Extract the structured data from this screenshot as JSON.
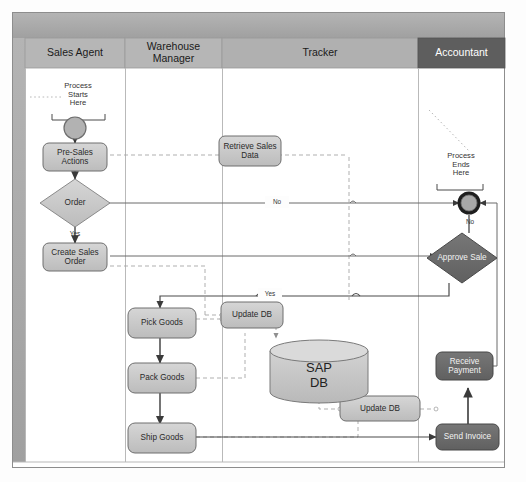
{
  "diagram": {
    "type": "swimlane-flowchart",
    "lanes": [
      {
        "id": "sales-agent",
        "label": "Sales Agent",
        "x": 25,
        "w": 100,
        "header_fill": "#b6b6b6",
        "header_text": "#1a1a1a"
      },
      {
        "id": "warehouse-manager",
        "label": "Warehouse Manager",
        "x": 125,
        "w": 97,
        "header_fill": "#b6b6b6",
        "header_text": "#1a1a1a"
      },
      {
        "id": "tracker",
        "label": "Tracker",
        "x": 222,
        "w": 196,
        "header_fill": "#b0b0b0",
        "header_text": "#1a1a1a"
      },
      {
        "id": "accountant",
        "label": "Accountant",
        "x": 418,
        "w": 87,
        "header_fill": "#5e5e5e",
        "header_text": "#ffffff"
      }
    ],
    "annotations": [
      {
        "id": "process-starts-here",
        "text": "Process Starts Here",
        "lines": [
          "Process",
          "Starts",
          "Here"
        ]
      },
      {
        "id": "process-ends-here",
        "text": "Process Ends Here",
        "lines": [
          "Process",
          "Ends",
          "Here"
        ]
      }
    ],
    "nodes": [
      {
        "id": "start-event",
        "kind": "start",
        "label": "",
        "lane": "sales-agent"
      },
      {
        "id": "pre-sales-actions",
        "kind": "task",
        "label": "Pre-Sales Actions",
        "lines": [
          "Pre-Sales",
          "Actions"
        ],
        "lane": "sales-agent"
      },
      {
        "id": "order-decision",
        "kind": "decision",
        "label": "Order",
        "lines": [
          "Order"
        ],
        "lane": "sales-agent"
      },
      {
        "id": "create-sales-order",
        "kind": "task",
        "label": "Create Sales Order",
        "lines": [
          "Create Sales",
          "Order"
        ],
        "lane": "sales-agent"
      },
      {
        "id": "pick-goods",
        "kind": "task",
        "label": "Pick Goods",
        "lines": [
          "Pick Goods"
        ],
        "lane": "warehouse-manager"
      },
      {
        "id": "pack-goods",
        "kind": "task",
        "label": "Pack Goods",
        "lines": [
          "Pack Goods"
        ],
        "lane": "warehouse-manager"
      },
      {
        "id": "ship-goods",
        "kind": "task",
        "label": "Ship Goods",
        "lines": [
          "Ship Goods"
        ],
        "lane": "warehouse-manager"
      },
      {
        "id": "retrieve-sales-data",
        "kind": "task",
        "label": "Retrieve Sales Data",
        "lines": [
          "Retrieve Sales",
          "Data"
        ],
        "lane": "tracker"
      },
      {
        "id": "update-db-1",
        "kind": "task",
        "label": "Update DB",
        "lines": [
          "Update DB"
        ],
        "lane": "tracker"
      },
      {
        "id": "update-db-2",
        "kind": "task",
        "label": "Update DB",
        "lines": [
          "Update DB"
        ],
        "lane": "tracker"
      },
      {
        "id": "sap-db",
        "kind": "database",
        "label": "SAP DB",
        "lines": [
          "SAP",
          "DB"
        ],
        "lane": "tracker"
      },
      {
        "id": "end-event",
        "kind": "end",
        "label": "",
        "lane": "accountant"
      },
      {
        "id": "approve-sale",
        "kind": "decision-dark",
        "label": "Approve Sale",
        "lines": [
          "Approve Sale"
        ],
        "lane": "accountant"
      },
      {
        "id": "receive-payment",
        "kind": "task-dark",
        "label": "Receive Payment",
        "lines": [
          "Receive",
          "Payment"
        ],
        "lane": "accountant"
      },
      {
        "id": "send-invoice",
        "kind": "task-dark",
        "label": "Send Invoice",
        "lines": [
          "Send Invoice"
        ],
        "lane": "accountant"
      }
    ],
    "edge_labels": [
      {
        "id": "order-yes",
        "text": "Yes"
      },
      {
        "id": "order-no",
        "text": "No"
      },
      {
        "id": "approve-no",
        "text": "No"
      },
      {
        "id": "update-yes",
        "text": "Yes"
      }
    ],
    "colors": {
      "node_fill": "#c9c9c9",
      "node_stroke": "#6e6e6e",
      "node_dark_fill": "#6b6b6b",
      "node_dark_stroke": "#474747",
      "lane_border": "#9a9a9a",
      "pool_band": "#a8a8a8",
      "connector": "#5a5a5a",
      "connector_dashed": "#a6a6a6",
      "canvas": "#fdfdfd"
    }
  }
}
